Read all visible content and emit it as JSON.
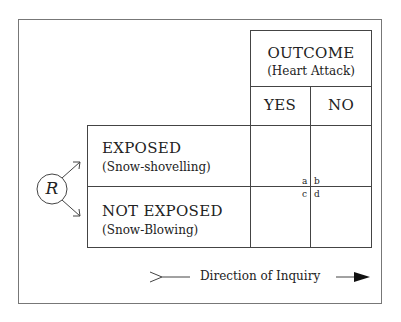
{
  "outcome": {
    "title": "OUTCOME",
    "subtitle": "(Heart Attack)",
    "columns": [
      "YES",
      "NO"
    ]
  },
  "exposure": {
    "rows": [
      {
        "label": "EXPOSED",
        "sublabel": "(Snow-shovelling)"
      },
      {
        "label": "NOT EXPOSED",
        "sublabel": "(Snow-Blowing)"
      }
    ]
  },
  "randomization": {
    "symbol": "R"
  },
  "cells": {
    "a": "a",
    "b": "b",
    "c": "c",
    "d": "d"
  },
  "direction": {
    "label": "Direction of Inquiry"
  }
}
